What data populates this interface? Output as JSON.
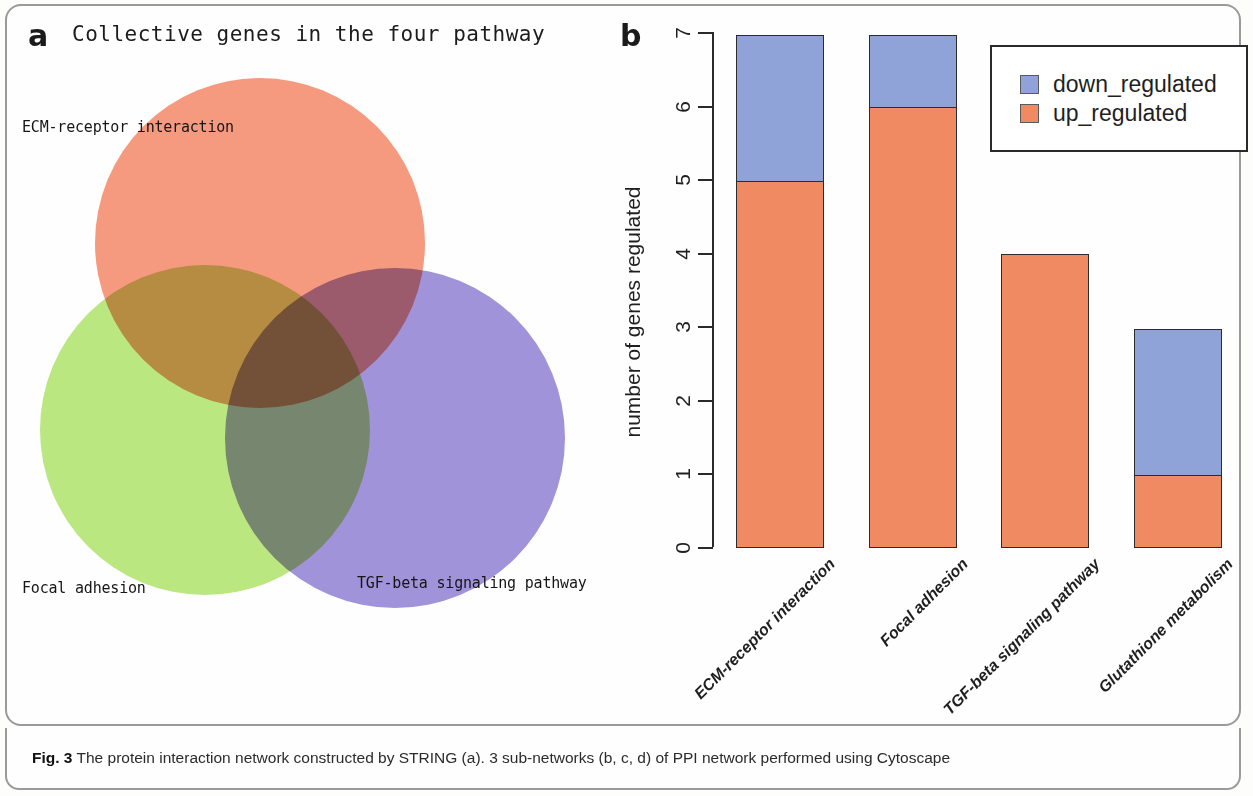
{
  "figure": {
    "panel_a_letter": "a",
    "panel_b_letter": "b",
    "caption_prefix": "Fig. 3",
    "caption_text": " The protein interaction network constructed by STRING (a). 3 sub-networks (b, c, d) of PPI network performed using Cytoscape"
  },
  "panel_a": {
    "title": "Collective genes in the four pathway",
    "labels": {
      "ecm": "ECM-receptor interaction",
      "focal": "Focal adhesion",
      "tgf": "TGF-beta signaling pathway"
    },
    "colors": {
      "ecm": "#f79b80",
      "focal": "#bce882",
      "tgf": "#a294da"
    }
  },
  "chart_data": {
    "type": "bar",
    "subtype": "stacked",
    "title": "",
    "xlabel": "",
    "ylabel": "number of genes regulated",
    "ylim": [
      0,
      7
    ],
    "yticks": [
      0,
      1,
      2,
      3,
      4,
      5,
      6,
      7
    ],
    "ytick_labels": [
      "0",
      "1",
      "2",
      "3",
      "4",
      "5",
      "6",
      "7"
    ],
    "grid": false,
    "legend_position": "top-right",
    "categories": [
      "ECM-receptor interaction",
      "Focal adhesion",
      "TGF-beta signaling pathway",
      "Glutathione metabolism"
    ],
    "series": [
      {
        "name": "up_regulated",
        "color": "#f08a63",
        "values": [
          5,
          6,
          4,
          1
        ]
      },
      {
        "name": "down_regulated",
        "color": "#8fa3d8",
        "values": [
          2,
          1,
          0,
          2
        ]
      }
    ],
    "totals": [
      7,
      7,
      4,
      3
    ]
  }
}
